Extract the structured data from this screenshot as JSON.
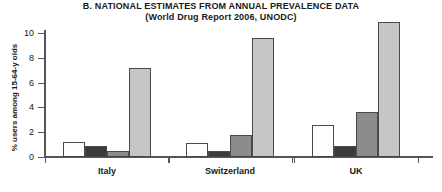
{
  "chart_data": {
    "type": "bar",
    "title": "B. NATIONAL ESTIMATES FROM ANNUAL PREVALENCE DATA",
    "subtitle": "(World Drug Report 2006, UNODC)",
    "xlabel": "",
    "ylabel": "% users among 15-64-y olds",
    "ylim": [
      0,
      11.5
    ],
    "yticks": [
      0,
      2,
      4,
      6,
      8,
      10
    ],
    "ytick_labels": [
      "0",
      "2",
      "4",
      "6",
      "8",
      "10"
    ],
    "grid": false,
    "legend": "none",
    "categories": [
      "Italy",
      "Switzerland",
      "UK"
    ],
    "series": [
      {
        "name": "series-1",
        "color": "#fdfdfd",
        "values": [
          1.2,
          1.1,
          2.6
        ]
      },
      {
        "name": "series-2",
        "color": "#3a3a3a",
        "values": [
          0.9,
          0.45,
          0.9
        ]
      },
      {
        "name": "series-3",
        "color": "#8c8c8c",
        "values": [
          0.5,
          1.8,
          3.6
        ]
      },
      {
        "name": "series-4",
        "color": "#c6c6c6",
        "values": [
          7.2,
          9.6,
          10.9
        ]
      }
    ]
  },
  "style": {
    "axis_color": "#555555",
    "bar_edge_color": "#4a4a4a",
    "text_color": "#1a1a1a",
    "background": "#ffffff"
  }
}
